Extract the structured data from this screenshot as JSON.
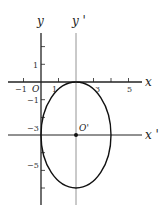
{
  "diagram": {
    "type": "ellipse-translation",
    "axes": {
      "x_label": "x",
      "y_label": "y",
      "x_prime_label": "x '",
      "y_prime_label": "y '",
      "origin_label": "O",
      "new_origin_label": "O'"
    },
    "x_ticks": [
      {
        "value": -1,
        "label": "−1"
      },
      {
        "value": 1,
        "label": "1"
      },
      {
        "value": 3,
        "label": "3"
      },
      {
        "value": 5,
        "label": "5"
      }
    ],
    "y_ticks": [
      {
        "value": 1,
        "label": "1"
      },
      {
        "value": -1,
        "label": "−1"
      },
      {
        "value": -3,
        "label": "−3"
      },
      {
        "value": -5,
        "label": "−5"
      }
    ],
    "ellipse": {
      "center": [
        2,
        -3
      ],
      "semi_axis_x": 2,
      "semi_axis_y": 3
    },
    "colors": {
      "axis": "#222222",
      "prime_axis": "#888888",
      "curve": "#111111"
    }
  }
}
